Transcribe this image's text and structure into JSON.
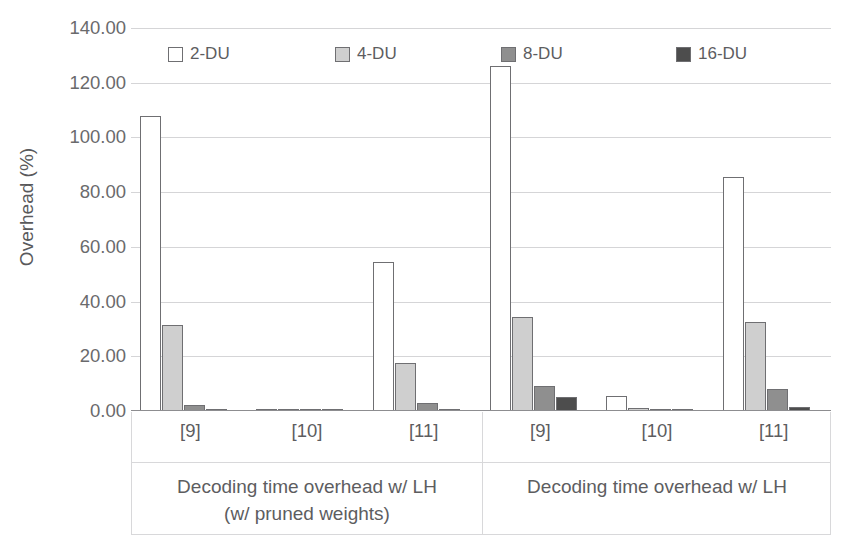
{
  "chart_data": {
    "type": "bar",
    "title": "",
    "xlabel": "",
    "ylabel": "Overhead (%)",
    "ylim": [
      0,
      140
    ],
    "ytick_labels": [
      "140.00",
      "120.00",
      "100.00",
      "80.00",
      "60.00",
      "40.00",
      "20.00",
      "0.00"
    ],
    "ytick_values": [
      140,
      120,
      100,
      80,
      60,
      40,
      20,
      0
    ],
    "grid": true,
    "legend_position": "top",
    "legend": [
      "2-DU",
      "4-DU",
      "8-DU",
      "16-DU"
    ],
    "series_colors": [
      "#ffffff",
      "#cfcfcf",
      "#8f8f8f",
      "#4d4d4d"
    ],
    "series_edge_color": "#6f6f72",
    "categories": [
      "[9]",
      "[10]",
      "[11]",
      "[9]",
      "[10]",
      "[11]"
    ],
    "panels": [
      {
        "title_line1": "Decoding time overhead w/ LH",
        "title_line2": "(w/ pruned weights)",
        "categories": [
          "[9]",
          "[10]",
          "[11]"
        ]
      },
      {
        "title_line1": "Decoding time overhead w/ LH",
        "title_line2": "",
        "categories": [
          "[9]",
          "[10]",
          "[11]"
        ]
      }
    ],
    "series": [
      {
        "name": "2-DU",
        "values": [
          108.0,
          0.7,
          54.5,
          126.0,
          5.6,
          85.5
        ]
      },
      {
        "name": "4-DU",
        "values": [
          31.5,
          0.4,
          17.5,
          34.5,
          1.1,
          32.5
        ]
      },
      {
        "name": "8-DU",
        "values": [
          2.2,
          0.3,
          3.0,
          9.0,
          0.6,
          8.0
        ]
      },
      {
        "name": "16-DU",
        "values": [
          0.8,
          0.2,
          0.5,
          5.2,
          0.3,
          1.5
        ]
      }
    ]
  },
  "legend": {
    "items": [
      {
        "label": "2-DU",
        "swatch_name": "legend-swatch-2du",
        "color": "#ffffff"
      },
      {
        "label": "4-DU",
        "swatch_name": "legend-swatch-4du",
        "color": "#cfcfcf"
      },
      {
        "label": "8-DU",
        "swatch_name": "legend-swatch-8du",
        "color": "#8f8f8f"
      },
      {
        "label": "16-DU",
        "swatch_name": "legend-swatch-16du",
        "color": "#4d4d4d"
      }
    ]
  },
  "axes": {
    "y_title": "Overhead (%)",
    "y_ticks": [
      "140.00",
      "120.00",
      "100.00",
      "80.00",
      "60.00",
      "40.00",
      "20.00",
      "0.00"
    ]
  }
}
